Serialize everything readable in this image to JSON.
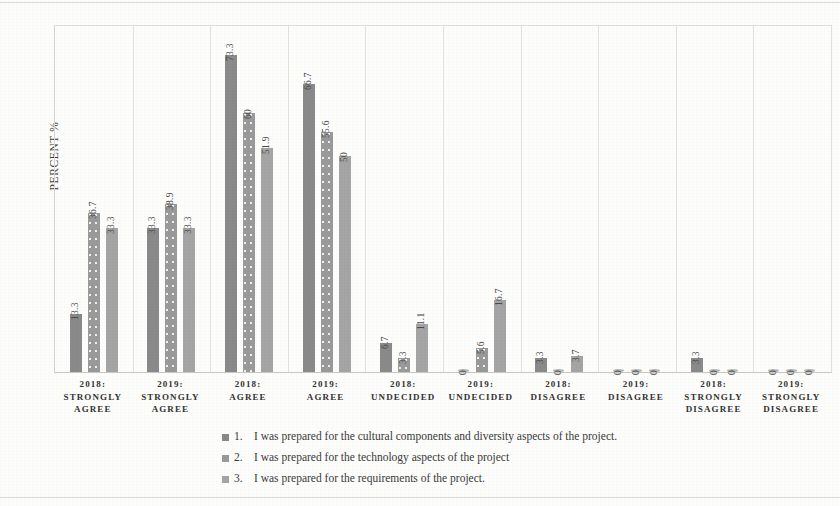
{
  "chart_data": {
    "type": "bar",
    "title": "",
    "xlabel": "",
    "ylabel": "PERCENT  %",
    "ylim": [
      0,
      80
    ],
    "grid": false,
    "legend_position": "bottom",
    "categories": [
      "2018: STRONGLY AGREE",
      "2019: STRONGLY AGREE",
      "2018: AGREE",
      "2019: AGREE",
      "2018: UNDECIDED",
      "2019: UNDECIDED",
      "2018: DISAGREE",
      "2019: DISAGREE",
      "2018: STRONGLY DISAGREE",
      "2019: STRONGLY DISAGREE"
    ],
    "category_lines": [
      [
        "2018:",
        "STRONGLY",
        "AGREE"
      ],
      [
        "2019:",
        "STRONGLY",
        "AGREE"
      ],
      [
        "2018:",
        "AGREE"
      ],
      [
        "2019:",
        "AGREE"
      ],
      [
        "2018:",
        "UNDECIDED"
      ],
      [
        "2019:",
        "UNDECIDED"
      ],
      [
        "2018:",
        "DISAGREE"
      ],
      [
        "2019:",
        "DISAGREE"
      ],
      [
        "2018:",
        "STRONGLY",
        "DISAGREE"
      ],
      [
        "2019:",
        "STRONGLY",
        "DISAGREE"
      ]
    ],
    "series": [
      {
        "name": "1.  I was prepared for the cultural components and diversity aspects of the project.",
        "color": "#8a8a8a",
        "values": [
          13.3,
          33.3,
          73.3,
          66.7,
          6.7,
          0,
          3.3,
          0,
          3.3,
          0
        ],
        "labels": [
          "13.3",
          "33.3",
          "73.3",
          "66.7",
          "6.7",
          "0",
          "3.3",
          "0",
          "3.3",
          "0"
        ]
      },
      {
        "name": "2.   I was prepared for the technology aspects of the project",
        "color": "#9a9a9a",
        "values": [
          36.7,
          38.9,
          60,
          55.6,
          3.3,
          5.6,
          0,
          0,
          0,
          0
        ],
        "labels": [
          "36.7",
          "38.9",
          "60",
          "55.6",
          "3.3",
          "5.6",
          "0",
          "0",
          "0",
          "0"
        ]
      },
      {
        "name": "3.  I was prepared for the requirements of the project.",
        "color": "#a5a5a5",
        "values": [
          33.3,
          33.3,
          51.9,
          50,
          11.1,
          16.7,
          3.7,
          0,
          0,
          0
        ],
        "labels": [
          "33.3",
          "33.3",
          "51.9",
          "50",
          "11.1",
          "16.7",
          "3.7",
          "0",
          "0",
          "0"
        ]
      }
    ]
  },
  "legend": {
    "items": [
      {
        "num": "1.",
        "text": "I was prepared for the cultural components and diversity aspects of the project."
      },
      {
        "num": "2.",
        "text": "I was prepared for the technology aspects of the project"
      },
      {
        "num": "3.",
        "text": "I was prepared for the requirements of the project."
      }
    ]
  }
}
